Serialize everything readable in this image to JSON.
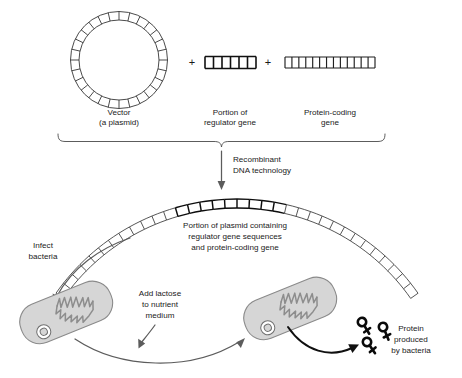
{
  "figure": {
    "background_color": "#ffffff",
    "width": 462,
    "height": 378
  },
  "colors": {
    "line": "#2b2b2b",
    "bold_line": "#0d0d0d",
    "cell_fill": "#d6d6d6",
    "cell_stroke": "#8a8a8a",
    "chromosome": "#8d8d8d",
    "arrow_gray": "#5c5c5c",
    "arrow_dark": "#101010",
    "text": "#1a1a1a"
  },
  "top_row": {
    "vector": {
      "label_line1": "Vector",
      "label_line2": "(a plasmid)",
      "segment_count": 28,
      "shape": "circular-plasmid"
    },
    "plus_1": "+",
    "regulator_gene": {
      "label_line1": "Portion of",
      "label_line2": "regulator gene",
      "segment_count": 6,
      "shape": "linear-dna-bold"
    },
    "plus_2": "+",
    "protein_coding_gene": {
      "label_line1": "Protein-coding",
      "label_line2": "gene",
      "segment_count": 13,
      "shape": "linear-dna-thin"
    }
  },
  "process": {
    "brace_label": "",
    "arrow_label_line1": "Recombinant",
    "arrow_label_line2": "DNA technology"
  },
  "recombinant_arc": {
    "caption_line1": "Portion of plasmid containing",
    "caption_line2": "regulator gene sequences",
    "caption_line3": "and protein-coding gene",
    "total_segments": 34,
    "bold_segment_start": 12,
    "bold_segment_end": 21
  },
  "steps": {
    "infect": {
      "label_line1": "Infect",
      "label_line2": "bacteria"
    },
    "lactose": {
      "label_line1": "Add lactose",
      "label_line2": "to nutrient",
      "label_line3": "medium"
    },
    "protein": {
      "label_line1": "Protein",
      "label_line2": "produced",
      "label_line3": "by bacteria",
      "glyph_count": 3
    }
  },
  "bacteria": [
    {
      "name": "bacterium-left",
      "state": "infected",
      "has_chromosome": true,
      "has_plasmid": true
    },
    {
      "name": "bacterium-right",
      "state": "expressing",
      "has_chromosome": true,
      "has_plasmid": true
    }
  ]
}
